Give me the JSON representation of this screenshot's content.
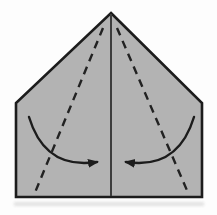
{
  "diagram": {
    "type": "origami-step-diagram",
    "canvas": {
      "width": 217,
      "height": 215
    },
    "paper": {
      "outline_points": "111,13 202,103 202,197 16,197 16,103",
      "center_crease_path": "M111 14 L111 196"
    },
    "fold_lines": [
      {
        "name": "left-valley-fold",
        "path": "M103 28 L34 195"
      },
      {
        "name": "right-valley-fold",
        "path": "M117 28 L189 195"
      }
    ],
    "arrows": [
      {
        "name": "left-fold-arrow",
        "path": "M29 117 Q45 170 97 162",
        "direction": "right"
      },
      {
        "name": "right-fold-arrow",
        "path": "M194 117 Q178 170 126 162",
        "direction": "left"
      }
    ],
    "shadow_rect": {
      "x": "14",
      "y": "202",
      "w": "190",
      "h": "4"
    },
    "colors": {
      "paper-fill": "#b3b3b3",
      "outline": "#1c1c1c",
      "crease": "#3d3d3d",
      "fold-line": "#222222",
      "arrow": "#1c1c1c",
      "background": "#fdfdfd",
      "shadow": "#cfcfcf"
    }
  }
}
